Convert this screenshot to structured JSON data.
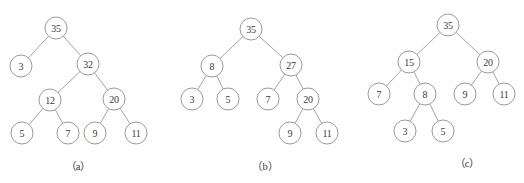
{
  "figure": {
    "width": 524,
    "height": 183,
    "background_color": "#fefefe",
    "node_stroke_color": "#8f8f8f",
    "edge_stroke_color": "#9a9a9a",
    "node_fill_color": "#ffffff",
    "label_color": "#3a3a3a",
    "node_radius": 11
  },
  "panels": [
    {
      "id": "a",
      "caption": "（a）",
      "caption_x": 78,
      "caption_y": 158,
      "nodes": [
        {
          "id": "a0",
          "label": "35",
          "x": 56,
          "y": 28
        },
        {
          "id": "a1",
          "label": "3",
          "x": 21,
          "y": 66
        },
        {
          "id": "a2",
          "label": "32",
          "x": 88,
          "y": 64
        },
        {
          "id": "a3",
          "label": "12",
          "x": 50,
          "y": 100
        },
        {
          "id": "a4",
          "label": "20",
          "x": 114,
          "y": 99
        },
        {
          "id": "a5",
          "label": "5",
          "x": 22,
          "y": 133
        },
        {
          "id": "a6",
          "label": "7",
          "x": 68,
          "y": 133
        },
        {
          "id": "a7",
          "label": "9",
          "x": 95,
          "y": 133
        },
        {
          "id": "a8",
          "label": "11",
          "x": 136,
          "y": 133
        }
      ],
      "edges": [
        {
          "from": "a0",
          "to": "a1"
        },
        {
          "from": "a0",
          "to": "a2"
        },
        {
          "from": "a2",
          "to": "a3"
        },
        {
          "from": "a2",
          "to": "a4"
        },
        {
          "from": "a3",
          "to": "a5"
        },
        {
          "from": "a3",
          "to": "a6"
        },
        {
          "from": "a4",
          "to": "a7"
        },
        {
          "from": "a4",
          "to": "a8"
        }
      ]
    },
    {
      "id": "b",
      "caption": "（b）",
      "caption_x": 265,
      "caption_y": 158,
      "nodes": [
        {
          "id": "b0",
          "label": "35",
          "x": 251,
          "y": 29
        },
        {
          "id": "b1",
          "label": "8",
          "x": 212,
          "y": 66
        },
        {
          "id": "b2",
          "label": "27",
          "x": 291,
          "y": 65
        },
        {
          "id": "b3",
          "label": "3",
          "x": 192,
          "y": 99
        },
        {
          "id": "b4",
          "label": "5",
          "x": 228,
          "y": 99
        },
        {
          "id": "b5",
          "label": "7",
          "x": 268,
          "y": 99
        },
        {
          "id": "b6",
          "label": "20",
          "x": 308,
          "y": 99
        },
        {
          "id": "b7",
          "label": "9",
          "x": 290,
          "y": 133
        },
        {
          "id": "b8",
          "label": "11",
          "x": 327,
          "y": 133
        }
      ],
      "edges": [
        {
          "from": "b0",
          "to": "b1"
        },
        {
          "from": "b0",
          "to": "b2"
        },
        {
          "from": "b1",
          "to": "b3"
        },
        {
          "from": "b1",
          "to": "b4"
        },
        {
          "from": "b2",
          "to": "b5"
        },
        {
          "from": "b2",
          "to": "b6"
        },
        {
          "from": "b6",
          "to": "b7"
        },
        {
          "from": "b6",
          "to": "b8"
        }
      ]
    },
    {
      "id": "c",
      "caption": "（c）",
      "caption_x": 467,
      "caption_y": 155,
      "nodes": [
        {
          "id": "c0",
          "label": "35",
          "x": 448,
          "y": 25
        },
        {
          "id": "c1",
          "label": "15",
          "x": 409,
          "y": 62
        },
        {
          "id": "c2",
          "label": "20",
          "x": 488,
          "y": 62
        },
        {
          "id": "c3",
          "label": "7",
          "x": 379,
          "y": 94
        },
        {
          "id": "c4",
          "label": "8",
          "x": 425,
          "y": 94
        },
        {
          "id": "c5",
          "label": "9",
          "x": 465,
          "y": 94
        },
        {
          "id": "c6",
          "label": "11",
          "x": 504,
          "y": 94
        },
        {
          "id": "c7",
          "label": "3",
          "x": 405,
          "y": 131
        },
        {
          "id": "c8",
          "label": "5",
          "x": 443,
          "y": 131
        }
      ],
      "edges": [
        {
          "from": "c0",
          "to": "c1"
        },
        {
          "from": "c0",
          "to": "c2"
        },
        {
          "from": "c1",
          "to": "c3"
        },
        {
          "from": "c1",
          "to": "c4"
        },
        {
          "from": "c2",
          "to": "c5"
        },
        {
          "from": "c2",
          "to": "c6"
        },
        {
          "from": "c4",
          "to": "c7"
        },
        {
          "from": "c4",
          "to": "c8"
        }
      ]
    }
  ]
}
